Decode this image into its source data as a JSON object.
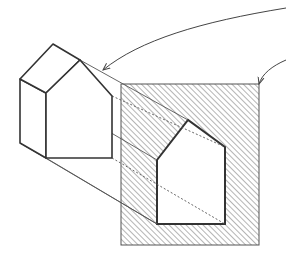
{
  "diagram": {
    "title": "",
    "colors": {
      "ink": "#333333",
      "thin_ink": "#555555",
      "hatch": "#777777",
      "background": "#ffffff"
    },
    "nodes": [
      {
        "id": "house-3d",
        "label": "",
        "shape": "extruded-pentagon"
      },
      {
        "id": "hatched-plane",
        "label": "",
        "shape": "rectangle-hatched"
      },
      {
        "id": "house-silhouette",
        "label": "",
        "shape": "pentagon-cutout"
      }
    ],
    "edges": [
      {
        "from": "top-right",
        "to": "house-3d",
        "type": "curved-arrow"
      },
      {
        "from": "top-right",
        "to": "hatched-plane",
        "type": "curved-arrow"
      },
      {
        "from": "house-3d",
        "to": "house-silhouette",
        "type": "projection-lines"
      }
    ]
  }
}
